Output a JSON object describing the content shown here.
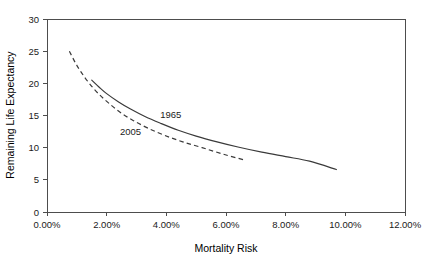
{
  "chart_data": {
    "type": "line",
    "title": "",
    "xlabel": "Mortality Risk",
    "ylabel": "Remaining Life Expectancy",
    "xlim": [
      0,
      12
    ],
    "ylim": [
      0,
      30
    ],
    "grid": false,
    "legend_position": "inline-annotations",
    "x_tick_labels": [
      "0.00%",
      "2.00%",
      "4.00%",
      "6.00%",
      "8.00%",
      "10.00%",
      "12.00%"
    ],
    "x_tick_values": [
      0,
      2,
      4,
      6,
      8,
      10,
      12
    ],
    "y_tick_labels": [
      "0",
      "5",
      "10",
      "15",
      "20",
      "25",
      "30"
    ],
    "y_tick_values": [
      0,
      5,
      10,
      15,
      20,
      25,
      30
    ],
    "series": [
      {
        "name": "1965",
        "style": "solid",
        "color": "#3a3a3a",
        "label_x": 4.15,
        "label_y": 14.6,
        "x": [
          1.5,
          1.75,
          2.0,
          2.4,
          2.8,
          3.3,
          3.8,
          4.4,
          5.0,
          5.7,
          6.4,
          7.2,
          8.0,
          8.8,
          9.7
        ],
        "y": [
          20.5,
          19.4,
          18.4,
          17.1,
          16.0,
          14.8,
          13.8,
          12.7,
          11.8,
          10.9,
          10.1,
          9.3,
          8.6,
          7.9,
          6.6
        ]
      },
      {
        "name": "2005",
        "style": "dashed",
        "color": "#3a3a3a",
        "label_x": 2.8,
        "label_y": 12.0,
        "x": [
          0.75,
          0.95,
          1.15,
          1.4,
          1.7,
          2.05,
          2.45,
          2.9,
          3.4,
          3.95,
          4.55,
          5.2,
          5.9,
          6.6
        ],
        "y": [
          25.0,
          23.2,
          21.7,
          20.1,
          18.5,
          17.0,
          15.5,
          14.2,
          13.0,
          11.9,
          10.9,
          10.0,
          9.0,
          8.1
        ]
      }
    ]
  },
  "axes": {
    "x_title": "Mortality Risk",
    "y_title": "Remaining Life Expectancy"
  },
  "ticks": {
    "x": [
      "0.00%",
      "2.00%",
      "4.00%",
      "6.00%",
      "8.00%",
      "10.00%",
      "12.00%"
    ],
    "y": [
      "0",
      "5",
      "10",
      "15",
      "20",
      "25",
      "30"
    ]
  },
  "annotations": {
    "series_1965": "1965",
    "series_2005": "2005"
  },
  "colors": {
    "curve": "#3a3a3a",
    "frame": "#4d4d4d",
    "background": "#ffffff",
    "text": "#1a1a1a"
  }
}
